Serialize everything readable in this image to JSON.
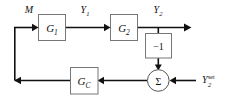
{
  "diagram": {
    "canvas": {
      "width": 227,
      "height": 101
    },
    "colors": {
      "wire": "#111111",
      "block_stroke": "#777777",
      "block_fill": "#ffffff",
      "background": "#ffffff",
      "text": "#111111"
    },
    "blocks": [
      {
        "id": "g1",
        "name": "process-block-g1",
        "label_main": "G",
        "label_sub": "1",
        "x": 38,
        "y": 14,
        "w": 27,
        "h": 26
      },
      {
        "id": "g2",
        "name": "process-block-g2",
        "label_main": "G",
        "label_sub": "2",
        "x": 110,
        "y": 14,
        "w": 27,
        "h": 26
      },
      {
        "id": "gain",
        "name": "gain-block-negative-one",
        "label_main": "−1",
        "label_sub": "",
        "x": 145,
        "y": 33,
        "w": 27,
        "h": 25
      },
      {
        "id": "gc",
        "name": "controller-block-gc",
        "label_main": "G",
        "label_sub": "C",
        "x": 70,
        "y": 67,
        "w": 28,
        "h": 27
      }
    ],
    "summing_junction": {
      "name": "summing-junction",
      "label": "Σ",
      "cx": 158,
      "cy": 80,
      "r": 11
    },
    "signals": [
      {
        "id": "m",
        "name": "signal-label-m",
        "main": "M",
        "sub": "",
        "sup": "",
        "x": 24,
        "y": 12
      },
      {
        "id": "y1",
        "name": "signal-label-y1",
        "main": "Y",
        "sub": "1",
        "sup": "",
        "x": 84,
        "y": 12
      },
      {
        "id": "y2",
        "name": "signal-label-y2",
        "main": "Y",
        "sub": "2",
        "sup": "",
        "x": 152,
        "y": 12
      },
      {
        "id": "y2set",
        "name": "signal-label-y2-setpoint",
        "main": "Y",
        "sub": "2",
        "sup": "set",
        "x": 204,
        "y": 84
      }
    ],
    "connections": [
      {
        "id": "m-to-g1",
        "name": "wire-m-to-g1",
        "from": "feedback-corner-top-left",
        "to": "g1"
      },
      {
        "id": "g1-to-g2",
        "name": "wire-g1-to-g2",
        "from": "g1",
        "to": "g2"
      },
      {
        "id": "g2-to-output",
        "name": "wire-g2-to-output",
        "from": "g2",
        "to": "output"
      },
      {
        "id": "y2-to-gain",
        "name": "wire-y2-branch-to-gain",
        "from": "y2-branch",
        "to": "gain"
      },
      {
        "id": "gain-to-sum",
        "name": "wire-gain-to-sum",
        "from": "gain",
        "to": "summing-junction"
      },
      {
        "id": "setpoint-to-sum",
        "name": "wire-setpoint-to-sum",
        "from": "y2set",
        "to": "summing-junction"
      },
      {
        "id": "sum-to-gc",
        "name": "wire-sum-to-gc",
        "from": "summing-junction",
        "to": "gc"
      },
      {
        "id": "gc-to-left",
        "name": "wire-gc-to-left-corner",
        "from": "gc",
        "to": "feedback-corner-bottom-left"
      },
      {
        "id": "left-riser",
        "name": "wire-left-feedback-riser",
        "from": "feedback-corner-bottom-left",
        "to": "feedback-corner-top-left"
      }
    ]
  }
}
